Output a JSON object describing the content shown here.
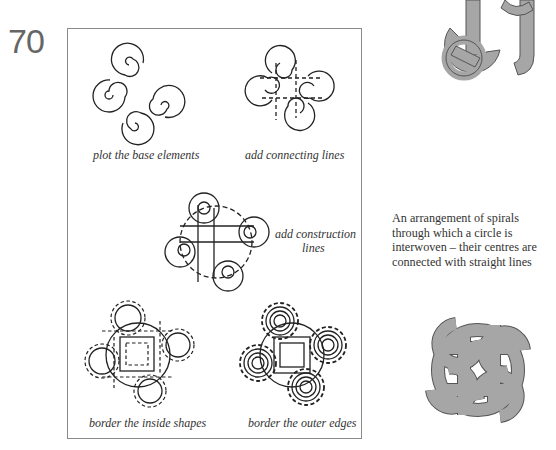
{
  "page": {
    "number": "70"
  },
  "steps": [
    {
      "id": "step1",
      "caption": "plot the base elements"
    },
    {
      "id": "step2",
      "caption": "add connecting lines"
    },
    {
      "id": "step3",
      "caption_line1": "add construction",
      "caption_line2": "lines"
    },
    {
      "id": "step4",
      "caption": "border the inside shapes"
    },
    {
      "id": "step5",
      "caption": "border the outer edges"
    }
  ],
  "side": {
    "description_lines": [
      "An arrangement of spirals",
      "through which a circle is",
      "interwoven – their centres are",
      "connected with straight lines"
    ]
  },
  "colors": {
    "frame": "#8a8a8a",
    "knot_fill": "#a6a6a6",
    "knot_stroke": "#555555",
    "ink": "#222222"
  }
}
